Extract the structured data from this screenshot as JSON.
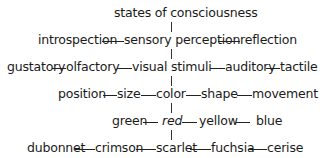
{
  "diagram": {
    "title": "states of consciousness",
    "rows": [
      {
        "nodes": [
          "introspection",
          "sensory perception",
          "reflection"
        ]
      },
      {
        "nodes": [
          "gustatory",
          "olfactory",
          "visual stimuli",
          "auditory",
          "tactile"
        ]
      },
      {
        "nodes": [
          "position",
          "size",
          "color",
          "shape",
          "movement"
        ]
      },
      {
        "nodes": [
          "green",
          "red",
          "yellow",
          "blue"
        ],
        "italic_node": "red"
      },
      {
        "nodes": [
          "dubonnet",
          "crimson",
          "scarlet",
          "fuchsia",
          "cerise"
        ]
      }
    ]
  }
}
